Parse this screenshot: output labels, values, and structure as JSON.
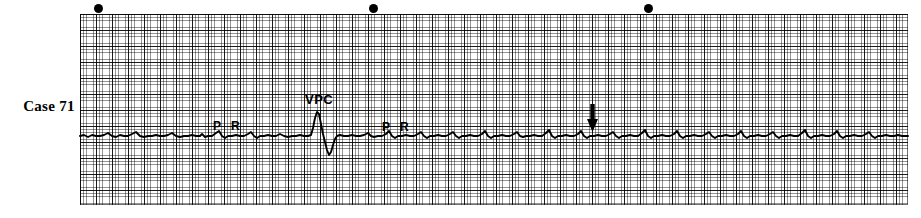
{
  "figure": {
    "case_label": "Case 71",
    "type": "ecg-rhythm-strip"
  },
  "annotations": [
    {
      "name": "p-wave-marker-1",
      "label": "P",
      "x": 213,
      "y": 119
    },
    {
      "name": "r-wave-marker-1",
      "label": "R",
      "x": 231,
      "y": 119
    },
    {
      "name": "vpc-marker",
      "label": "VPC",
      "x": 305,
      "y": 92
    },
    {
      "name": "p-wave-marker-2",
      "label": "P",
      "x": 382,
      "y": 120
    },
    {
      "name": "r-wave-marker-2",
      "label": "R",
      "x": 400,
      "y": 120
    }
  ],
  "arrow_marker": {
    "name": "downward-arrow-marker",
    "direction": "down",
    "x": 586,
    "y": 104
  },
  "calibration_dots": [
    {
      "x": 94,
      "y": 4
    },
    {
      "x": 369,
      "y": 4
    },
    {
      "x": 644,
      "y": 4
    }
  ],
  "grid": {
    "left": 80,
    "top": 14,
    "width": 828,
    "height": 191,
    "small_box_px": 3.2,
    "large_box_px": 16,
    "grid_color": "#000000",
    "paper_color": "#ffffff"
  },
  "chart_data": {
    "type": "line",
    "title": "Case 71",
    "xlabel": "",
    "ylabel": "",
    "grid": true,
    "legend": "none",
    "trace_color": "#000000",
    "baseline_y": 136,
    "x_range": [
      80,
      908
    ],
    "y_range": [
      14,
      205
    ],
    "series": [
      {
        "name": "ecg-lead-trace",
        "description": "Single-lead rhythm strip: low-amplitude irregular baseline beats with one tall premature ventricular complex (VPC) near x=318.",
        "points": [
          [
            80,
            136
          ],
          [
            84,
            135
          ],
          [
            88,
            137
          ],
          [
            92,
            135
          ],
          [
            96,
            136
          ],
          [
            100,
            136
          ],
          [
            104,
            135
          ],
          [
            108,
            133
          ],
          [
            112,
            136
          ],
          [
            116,
            137
          ],
          [
            120,
            135
          ],
          [
            124,
            136
          ],
          [
            128,
            136
          ],
          [
            132,
            134
          ],
          [
            136,
            132
          ],
          [
            140,
            136
          ],
          [
            144,
            137
          ],
          [
            148,
            136
          ],
          [
            152,
            136
          ],
          [
            156,
            135
          ],
          [
            160,
            136
          ],
          [
            164,
            136
          ],
          [
            168,
            135
          ],
          [
            172,
            133
          ],
          [
            176,
            136
          ],
          [
            180,
            137
          ],
          [
            184,
            136
          ],
          [
            188,
            136
          ],
          [
            192,
            135
          ],
          [
            196,
            136
          ],
          [
            200,
            136
          ],
          [
            202,
            134
          ],
          [
            205,
            137
          ],
          [
            208,
            136
          ],
          [
            212,
            136
          ],
          [
            216,
            133
          ],
          [
            219,
            131
          ],
          [
            222,
            136
          ],
          [
            225,
            138
          ],
          [
            228,
            136
          ],
          [
            232,
            136
          ],
          [
            236,
            135
          ],
          [
            240,
            136
          ],
          [
            244,
            136
          ],
          [
            248,
            134
          ],
          [
            251,
            132
          ],
          [
            254,
            136
          ],
          [
            257,
            138
          ],
          [
            260,
            136
          ],
          [
            264,
            136
          ],
          [
            268,
            135
          ],
          [
            272,
            136
          ],
          [
            276,
            136
          ],
          [
            280,
            134
          ],
          [
            284,
            136
          ],
          [
            288,
            137
          ],
          [
            292,
            136
          ],
          [
            296,
            136
          ],
          [
            300,
            135
          ],
          [
            304,
            136
          ],
          [
            308,
            136
          ],
          [
            311,
            135
          ],
          [
            313,
            128
          ],
          [
            315,
            118
          ],
          [
            317,
            112
          ],
          [
            319,
            114
          ],
          [
            321,
            124
          ],
          [
            323,
            134
          ],
          [
            325,
            142
          ],
          [
            327,
            150
          ],
          [
            329,
            155
          ],
          [
            331,
            152
          ],
          [
            333,
            145
          ],
          [
            335,
            139
          ],
          [
            337,
            136
          ],
          [
            340,
            135
          ],
          [
            344,
            136
          ],
          [
            348,
            136
          ],
          [
            352,
            135
          ],
          [
            356,
            136
          ],
          [
            360,
            136
          ],
          [
            364,
            135
          ],
          [
            368,
            133
          ],
          [
            371,
            136
          ],
          [
            374,
            137
          ],
          [
            378,
            136
          ],
          [
            382,
            136
          ],
          [
            386,
            134
          ],
          [
            389,
            131
          ],
          [
            392,
            136
          ],
          [
            395,
            138
          ],
          [
            398,
            136
          ],
          [
            402,
            136
          ],
          [
            406,
            135
          ],
          [
            410,
            136
          ],
          [
            414,
            136
          ],
          [
            418,
            134
          ],
          [
            421,
            132
          ],
          [
            424,
            136
          ],
          [
            427,
            138
          ],
          [
            430,
            136
          ],
          [
            434,
            136
          ],
          [
            438,
            135
          ],
          [
            442,
            136
          ],
          [
            446,
            136
          ],
          [
            450,
            134
          ],
          [
            453,
            132
          ],
          [
            456,
            136
          ],
          [
            459,
            138
          ],
          [
            462,
            136
          ],
          [
            466,
            136
          ],
          [
            470,
            135
          ],
          [
            474,
            136
          ],
          [
            478,
            136
          ],
          [
            482,
            134
          ],
          [
            485,
            131
          ],
          [
            488,
            136
          ],
          [
            491,
            138
          ],
          [
            494,
            136
          ],
          [
            498,
            136
          ],
          [
            502,
            135
          ],
          [
            506,
            136
          ],
          [
            510,
            136
          ],
          [
            514,
            134
          ],
          [
            517,
            132
          ],
          [
            520,
            136
          ],
          [
            523,
            137
          ],
          [
            526,
            136
          ],
          [
            530,
            136
          ],
          [
            534,
            135
          ],
          [
            538,
            136
          ],
          [
            542,
            136
          ],
          [
            546,
            133
          ],
          [
            549,
            130
          ],
          [
            552,
            136
          ],
          [
            555,
            138
          ],
          [
            558,
            136
          ],
          [
            562,
            136
          ],
          [
            566,
            135
          ],
          [
            570,
            136
          ],
          [
            574,
            136
          ],
          [
            578,
            134
          ],
          [
            581,
            131
          ],
          [
            584,
            136
          ],
          [
            587,
            138
          ],
          [
            590,
            136
          ],
          [
            594,
            136
          ],
          [
            598,
            135
          ],
          [
            602,
            136
          ],
          [
            606,
            136
          ],
          [
            610,
            134
          ],
          [
            613,
            132
          ],
          [
            616,
            136
          ],
          [
            619,
            138
          ],
          [
            622,
            136
          ],
          [
            626,
            136
          ],
          [
            630,
            135
          ],
          [
            634,
            136
          ],
          [
            638,
            136
          ],
          [
            642,
            133
          ],
          [
            645,
            130
          ],
          [
            648,
            136
          ],
          [
            651,
            138
          ],
          [
            654,
            136
          ],
          [
            658,
            136
          ],
          [
            662,
            135
          ],
          [
            666,
            136
          ],
          [
            670,
            136
          ],
          [
            674,
            134
          ],
          [
            677,
            131
          ],
          [
            680,
            136
          ],
          [
            683,
            138
          ],
          [
            686,
            136
          ],
          [
            690,
            136
          ],
          [
            694,
            135
          ],
          [
            698,
            136
          ],
          [
            702,
            136
          ],
          [
            706,
            134
          ],
          [
            709,
            132
          ],
          [
            712,
            136
          ],
          [
            715,
            138
          ],
          [
            718,
            136
          ],
          [
            722,
            136
          ],
          [
            726,
            135
          ],
          [
            730,
            136
          ],
          [
            734,
            136
          ],
          [
            738,
            134
          ],
          [
            741,
            131
          ],
          [
            744,
            136
          ],
          [
            747,
            138
          ],
          [
            750,
            136
          ],
          [
            754,
            136
          ],
          [
            758,
            135
          ],
          [
            762,
            136
          ],
          [
            766,
            136
          ],
          [
            770,
            134
          ],
          [
            773,
            132
          ],
          [
            776,
            136
          ],
          [
            779,
            138
          ],
          [
            782,
            136
          ],
          [
            786,
            136
          ],
          [
            790,
            135
          ],
          [
            794,
            136
          ],
          [
            798,
            136
          ],
          [
            802,
            133
          ],
          [
            805,
            130
          ],
          [
            808,
            136
          ],
          [
            811,
            138
          ],
          [
            814,
            136
          ],
          [
            818,
            136
          ],
          [
            822,
            135
          ],
          [
            826,
            136
          ],
          [
            830,
            136
          ],
          [
            834,
            134
          ],
          [
            837,
            131
          ],
          [
            840,
            136
          ],
          [
            843,
            138
          ],
          [
            846,
            136
          ],
          [
            850,
            136
          ],
          [
            854,
            135
          ],
          [
            858,
            136
          ],
          [
            862,
            136
          ],
          [
            866,
            134
          ],
          [
            869,
            132
          ],
          [
            872,
            136
          ],
          [
            875,
            138
          ],
          [
            878,
            136
          ],
          [
            882,
            136
          ],
          [
            886,
            135
          ],
          [
            890,
            136
          ],
          [
            894,
            136
          ],
          [
            898,
            135
          ],
          [
            902,
            136
          ],
          [
            908,
            136
          ]
        ]
      }
    ]
  }
}
